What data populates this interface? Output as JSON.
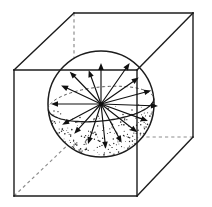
{
  "figure": {
    "caption": "",
    "background_color": "#ffffff",
    "line_color": "#1c1c1c",
    "hidden_line_color": "#8e8e8e",
    "arrow_color": "#101010",
    "stipple_color": "#2a2a2a"
  },
  "canvas": {
    "width": 212,
    "height": 207
  },
  "cube": {
    "label": "wireframe cube",
    "vertices": {
      "front_top_left": [
        14,
        70
      ],
      "front_top_right": [
        137,
        70
      ],
      "front_bottom_right": [
        137,
        196
      ],
      "front_bottom_left": [
        14,
        196
      ],
      "back_top_left": [
        74,
        13
      ],
      "back_top_right": [
        193,
        13
      ],
      "back_bottom_right": [
        193,
        137
      ],
      "back_bottom_left": [
        74,
        80
      ]
    },
    "visible_edges": [
      [
        [
          14,
          70
        ],
        [
          137,
          70
        ]
      ],
      [
        [
          137,
          70
        ],
        [
          137,
          196
        ]
      ],
      [
        [
          137,
          196
        ],
        [
          14,
          196
        ]
      ],
      [
        [
          14,
          196
        ],
        [
          14,
          70
        ]
      ],
      [
        [
          74,
          13
        ],
        [
          193,
          13
        ]
      ],
      [
        [
          193,
          13
        ],
        [
          193,
          137
        ]
      ],
      [
        [
          14,
          70
        ],
        [
          74,
          13
        ]
      ],
      [
        [
          137,
          70
        ],
        [
          193,
          13
        ]
      ],
      [
        [
          137,
          196
        ],
        [
          193,
          137
        ]
      ]
    ],
    "hidden_edges": [
      [
        [
          74,
          13
        ],
        [
          74,
          80
        ]
      ],
      [
        [
          193,
          137
        ],
        [
          137,
          137
        ]
      ],
      [
        [
          14,
          196
        ],
        [
          74,
          139
        ]
      ]
    ]
  },
  "sphere": {
    "label": "inscribed sphere",
    "center": [
      101,
      104
    ],
    "radius": 53,
    "equator": {
      "label": "equatorial great circle",
      "semi_major_axis": 53,
      "semi_minor_axis": 17,
      "tilt_degrees": -6
    },
    "shading": {
      "style": "stipple",
      "region": "lower-front hemisphere",
      "dot_count": 640
    }
  },
  "rays": {
    "label": "radiating direction vectors from center",
    "count": 16,
    "origin": [
      101,
      104
    ],
    "vectors": [
      {
        "name": "ray-up",
        "angle_degrees": 270,
        "length": 41,
        "head_size": 7
      },
      {
        "name": "ray-upper-right-steep",
        "angle_degrees": 305,
        "length": 50,
        "head_size": 7
      },
      {
        "name": "ray-upper-right",
        "angle_degrees": 325,
        "length": 46,
        "head_size": 7
      },
      {
        "name": "ray-right-upper",
        "angle_degrees": 345,
        "length": 52,
        "head_size": 7
      },
      {
        "name": "ray-right-far",
        "angle_degrees": 2,
        "length": 57,
        "head_size": 7
      },
      {
        "name": "ray-right-lower",
        "angle_degrees": 20,
        "length": 50,
        "head_size": 7
      },
      {
        "name": "ray-lower-right",
        "angle_degrees": 38,
        "length": 46,
        "head_size": 7
      },
      {
        "name": "ray-lower-right-steep",
        "angle_degrees": 62,
        "length": 44,
        "head_size": 7
      },
      {
        "name": "ray-down",
        "angle_degrees": 84,
        "length": 45,
        "head_size": 7
      },
      {
        "name": "ray-lower-left-steep",
        "angle_degrees": 108,
        "length": 42,
        "head_size": 7
      },
      {
        "name": "ray-lower-left",
        "angle_degrees": 132,
        "length": 40,
        "head_size": 7
      },
      {
        "name": "ray-left-lower",
        "angle_degrees": 152,
        "length": 44,
        "head_size": 7
      },
      {
        "name": "ray-left",
        "angle_degrees": 180,
        "length": 50,
        "head_size": 7
      },
      {
        "name": "ray-left-upper",
        "angle_degrees": 205,
        "length": 44,
        "head_size": 7
      },
      {
        "name": "ray-upper-left",
        "angle_degrees": 226,
        "length": 45,
        "head_size": 7
      },
      {
        "name": "ray-upper-left-steep",
        "angle_degrees": 250,
        "length": 36,
        "head_size": 7
      }
    ]
  }
}
